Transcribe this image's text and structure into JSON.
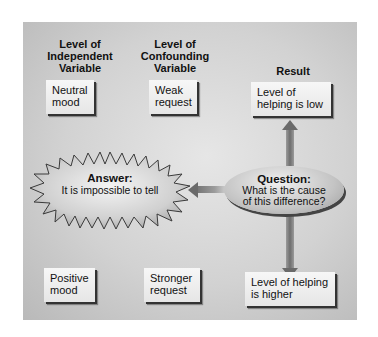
{
  "headers": {
    "independent": "Level of\nIndependent\nVariable",
    "confounding": "Level of\nConfounding\nVariable",
    "result": "Result"
  },
  "top_row": {
    "independent": "Neutral\nmood",
    "confounding": "Weak\nrequest",
    "result": "Level of\nhelping is low"
  },
  "bottom_row": {
    "independent": "Positive\nmood",
    "confounding": "Stronger\nrequest",
    "result": "Level of helping\nis higher"
  },
  "question": {
    "title": "Question:",
    "text": "What is the cause of this difference?"
  },
  "answer": {
    "title": "Answer:",
    "text": "It is impossible to tell"
  },
  "colors": {
    "panel": "#d2d2d2",
    "arrow": "#6a6a6a",
    "box_shadow": "#333333"
  }
}
